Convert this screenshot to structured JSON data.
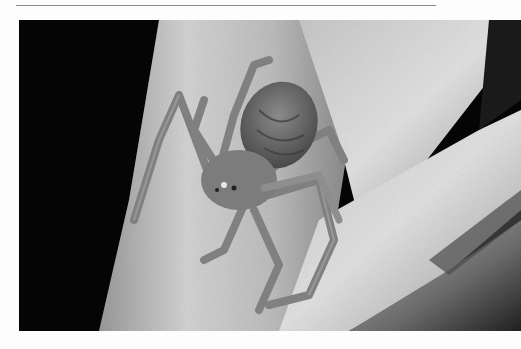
{
  "page": {
    "background": "#fdfdfd",
    "rule_color": "#8a8a8a"
  },
  "photo": {
    "subject": "crab spider on fuzzy plant stem",
    "tone": "grayscale",
    "colors": {
      "background": "#050505",
      "stem_light": "#d8d8d8",
      "stem_mid": "#a9a9a9",
      "stem_dark": "#5a5a5a",
      "spider_body": "#7a7a7a",
      "spider_abdomen": "#6a6a6a",
      "spider_legs": "#8c8c8c"
    }
  }
}
